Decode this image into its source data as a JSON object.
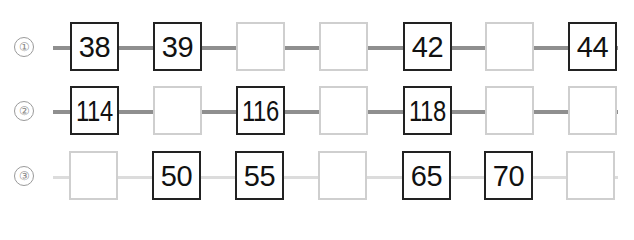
{
  "rows": [
    {
      "label": "①",
      "line_style": "dark",
      "cells": [
        "38",
        "39",
        "",
        "",
        "42",
        "",
        "44"
      ]
    },
    {
      "label": "②",
      "line_style": "dark",
      "cells": [
        "114",
        "",
        "116",
        "",
        "118",
        "",
        ""
      ]
    },
    {
      "label": "③",
      "line_style": "light",
      "cells": [
        "",
        "50",
        "55",
        "",
        "65",
        "70",
        ""
      ]
    }
  ]
}
